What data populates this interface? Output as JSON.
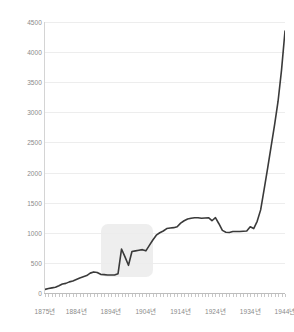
{
  "chart_data": {
    "type": "line",
    "title": "",
    "xlabel": "",
    "ylabel": "",
    "ylim": [
      0,
      4500
    ],
    "xlim": [
      1875,
      1944
    ],
    "grid": true,
    "legend": null,
    "y_ticks": [
      0,
      500,
      1000,
      1500,
      2000,
      2500,
      3000,
      3500,
      4000,
      4500
    ],
    "y_tick_labels": [
      "0",
      "500",
      "1000",
      "1500",
      "2000",
      "2500",
      "3000",
      "3500",
      "4000",
      "4500"
    ],
    "x_ticks": [
      1875,
      1884,
      1894,
      1904,
      1914,
      1924,
      1934,
      1944
    ],
    "x_tick_labels": [
      "1875년",
      "1884년",
      "1894년",
      "1904년",
      "1914년",
      "1924년",
      "1934년",
      "1944년"
    ],
    "series": [
      {
        "name": "series-1",
        "color": "#3a3a3a",
        "x": [
          1875,
          1876,
          1877,
          1878,
          1879,
          1880,
          1881,
          1882,
          1883,
          1884,
          1885,
          1886,
          1887,
          1888,
          1889,
          1890,
          1891,
          1892,
          1893,
          1894,
          1895,
          1896,
          1897,
          1898,
          1899,
          1900,
          1901,
          1902,
          1903,
          1904,
          1905,
          1906,
          1907,
          1908,
          1909,
          1910,
          1911,
          1912,
          1913,
          1914,
          1915,
          1916,
          1917,
          1918,
          1919,
          1920,
          1921,
          1922,
          1923,
          1924,
          1925,
          1926,
          1927,
          1928,
          1929,
          1930,
          1931,
          1932,
          1933,
          1934,
          1935,
          1936,
          1937,
          1938,
          1939,
          1940,
          1941,
          1942,
          1943,
          1944
        ],
        "values": [
          60,
          75,
          85,
          95,
          120,
          150,
          160,
          185,
          200,
          225,
          250,
          270,
          290,
          330,
          350,
          340,
          310,
          305,
          300,
          300,
          300,
          320,
          730,
          600,
          460,
          690,
          700,
          710,
          720,
          700,
          790,
          880,
          960,
          1000,
          1030,
          1070,
          1080,
          1085,
          1100,
          1160,
          1200,
          1230,
          1240,
          1250,
          1250,
          1240,
          1245,
          1250,
          1200,
          1250,
          1150,
          1040,
          1010,
          1005,
          1020,
          1020,
          1020,
          1025,
          1030,
          1100,
          1070,
          1190,
          1380,
          1720,
          2070,
          2430,
          2790,
          3180,
          3700,
          4350
        ]
      }
    ],
    "annotations": [
      {
        "type": "highlight-rect",
        "name": "highlight-region",
        "x_start": 1891,
        "x_end": 1906,
        "y_bottom": 270,
        "y_top": 1150,
        "color": "#ebebeb"
      }
    ]
  },
  "axis": {
    "y_axis_name": "y-axis",
    "x_axis_name": "x-axis"
  }
}
